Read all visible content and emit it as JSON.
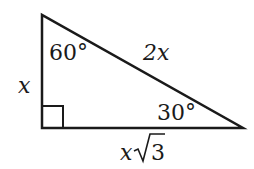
{
  "diagram": {
    "type": "right-triangle-30-60-90",
    "angles": {
      "top": "60°",
      "right": "30°",
      "bottom_left": "right-angle"
    },
    "sides": {
      "vertical_leg": "x",
      "hypotenuse": "2x",
      "horizontal_leg_var": "x",
      "horizontal_leg_radicand": "3"
    },
    "colors": {
      "stroke": "#1a1a1a",
      "background": "#ffffff"
    }
  }
}
